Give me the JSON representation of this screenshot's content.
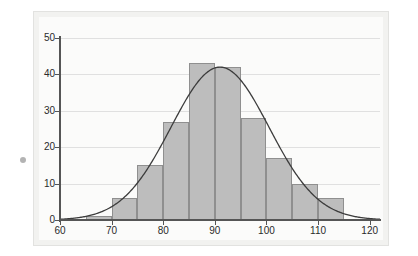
{
  "chart_data": {
    "type": "bar",
    "title": "",
    "subtitle": "",
    "xlabel": "",
    "ylabel": "",
    "xlim": [
      60,
      122
    ],
    "ylim": [
      0,
      50
    ],
    "grid": true,
    "legend": "none",
    "bin_width": 5,
    "categories": [
      "60-65",
      "65-70",
      "70-75",
      "75-80",
      "80-85",
      "85-90",
      "90-95",
      "95-100",
      "100-105",
      "105-110",
      "110-115",
      "115-120"
    ],
    "bin_edges": [
      60,
      65,
      70,
      75,
      80,
      85,
      90,
      95,
      100,
      105,
      110,
      115,
      120
    ],
    "values": [
      0,
      1,
      6,
      15,
      27,
      43,
      42,
      28,
      17,
      10,
      6,
      0
    ],
    "xticks": [
      60,
      70,
      80,
      90,
      100,
      110,
      120
    ],
    "xtick_labels": [
      "60",
      "70",
      "80",
      "90",
      "100",
      "110",
      "120"
    ],
    "yticks": [
      0,
      10,
      20,
      30,
      40,
      50
    ],
    "ytick_labels": [
      "0",
      "10",
      "20",
      "30",
      "40",
      "50"
    ],
    "overlay": {
      "type": "line",
      "name": "normal-curve",
      "mean": 91,
      "sigma": 9.5,
      "peak": 42,
      "color": "#3c3c3c"
    },
    "colors": {
      "bar_fill": "#bdbdbd",
      "bar_edge": "#8f8f8f",
      "curve": "#3c3c3c",
      "axis": "#555555",
      "grid": "#e0e0e0",
      "panel": "#f2f2f0",
      "background": "#ffffff"
    }
  }
}
